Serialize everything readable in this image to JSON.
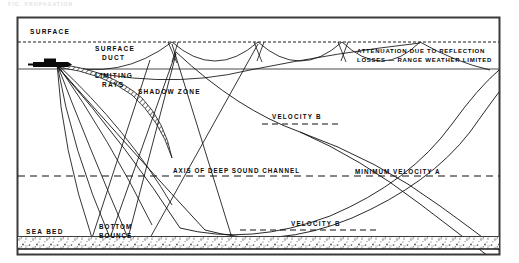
{
  "figure": {
    "ghost_header": "FIG.  PROPAGATION",
    "frame": {
      "x": 17,
      "y": 17,
      "width": 483,
      "height": 238,
      "border_color": "#3a3a3a"
    },
    "background": "#ffffff",
    "ink_color": "#0a0a0a"
  },
  "labels": {
    "surface": "SURFACE",
    "surface_duct_line1": "SURFACE",
    "surface_duct_line2": "DUCT",
    "attenuation_line1": "ATTENUATION DUE TO REFLECTION",
    "attenuation_line2": "LOSSES — RANGE WEATHER LIMITED",
    "limiting_rays_line1": "LIMITING",
    "limiting_rays_line2": "RAYS",
    "shadow_zone": "SHADOW ZONE",
    "velocity_b_upper": "VELOCITY  B",
    "axis_deep_sound_channel": "AXIS OF DEEP SOUND CHANNEL",
    "minimum_velocity_a": "MINIMUM VELOCITY A",
    "velocity_b_lower": "VELOCITY  B",
    "sea_bed": "SEA BED",
    "bottom_bounce_line1": "BOTTOM",
    "bottom_bounce_line2": "BOUNCE"
  },
  "diagram_data": {
    "type": "technical-diagram",
    "subject": "Underwater sound propagation paths",
    "layers": [
      {
        "name": "sea-surface",
        "y": 42,
        "style": "dashed"
      },
      {
        "name": "surface-duct-base",
        "y": 69,
        "style": "solid"
      },
      {
        "name": "deep-sound-channel-axis",
        "y": 176,
        "style": "dashed"
      },
      {
        "name": "velocity-b-upper-ref",
        "y": 124,
        "style": "dashed"
      },
      {
        "name": "velocity-b-lower-ref",
        "y": 230,
        "style": "dashed"
      },
      {
        "name": "sea-bed",
        "y": 238,
        "style": "stippled"
      }
    ],
    "source": {
      "name": "submarine-source",
      "x": 57,
      "y": 64
    },
    "features": [
      "surface duct with repeated surface reflections",
      "limiting rays bounding the shadow zone",
      "shadow zone below the surface duct",
      "deep sound channel convergence paths",
      "bottom bounce ray paths",
      "attenuation due to reflection losses at long range"
    ]
  }
}
